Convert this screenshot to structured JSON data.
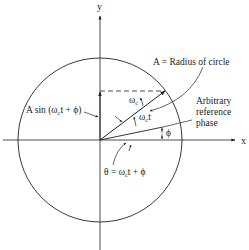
{
  "diagram": {
    "type": "phasor-rotating-vector",
    "axes": {
      "x_label": "x",
      "y_label": "y"
    },
    "labels": {
      "radius": "A = Radius of circle",
      "projection": "A sin (ω",
      "projection_sub": "c",
      "projection_tail": "t + ϕ)",
      "angular_velocity": "ω",
      "angular_velocity_sub": "c",
      "rotation_angle": "ω",
      "rotation_angle_sub": "c",
      "rotation_angle_tail": "t",
      "reference_line1": "Arbitrary",
      "reference_line2": "reference",
      "reference_line3": "phase",
      "phase": "ϕ",
      "theta": "θ = ω",
      "theta_sub": "c",
      "theta_tail": "t + ϕ"
    },
    "colors": {
      "line": "#222222",
      "background": "#ffffff"
    }
  }
}
